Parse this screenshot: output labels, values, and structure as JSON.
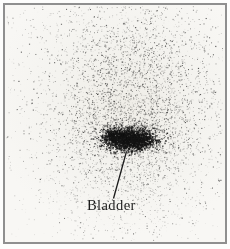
{
  "figure": {
    "label": "Bladder"
  },
  "colors": {
    "page_background": "#fdfdfc",
    "scan_background": "#f4f3ef",
    "scan_background_dark": "#efede7",
    "scan_background_light": "#f8f7f4",
    "frame_border": "#8f8f8f",
    "dot": "#141414",
    "annotation": "#1b1b1b"
  },
  "render": {
    "seed": 1337,
    "clip": {
      "x": 6,
      "y": 6,
      "w": 217,
      "h": 235
    },
    "regions": [
      {
        "name": "background-scatter",
        "type": "uniform",
        "count": 600,
        "x0": 7,
        "y0": 7,
        "x1": 222,
        "y1": 240,
        "rMin": 0.5,
        "rMax": 1.0,
        "aMin": 0.05,
        "aMax": 0.3
      },
      {
        "name": "body-cloud",
        "type": "gaussian",
        "count": 4200,
        "cx": 131,
        "cy": 95,
        "sx": 47,
        "sy": 57,
        "rMin": 0.5,
        "rMax": 1.2,
        "aMin": 0.1,
        "aMax": 0.72
      },
      {
        "name": "lower-fill",
        "type": "gaussian",
        "count": 600,
        "cx": 128,
        "cy": 178,
        "sx": 42,
        "sy": 30,
        "rMin": 0.5,
        "rMax": 1.0,
        "aMin": 0.07,
        "aMax": 0.4
      },
      {
        "name": "bladder-haze",
        "type": "gaussian",
        "count": 700,
        "cx": 127,
        "cy": 138,
        "sx": 24,
        "sy": 14,
        "rMin": 0.5,
        "rMax": 1.2,
        "aMin": 0.15,
        "aMax": 0.65
      },
      {
        "name": "bladder-core",
        "type": "gaussian",
        "count": 1500,
        "cx": 128,
        "cy": 139,
        "sx": 11.5,
        "sy": 5.5,
        "rMin": 0.8,
        "rMax": 1.7,
        "aMin": 0.55,
        "aMax": 0.95
      },
      {
        "name": "bladder-lobe-left",
        "type": "gaussian",
        "count": 350,
        "cx": 113,
        "cy": 136,
        "sx": 6,
        "sy": 4.5,
        "rMin": 0.8,
        "rMax": 1.6,
        "aMin": 0.5,
        "aMax": 0.92
      },
      {
        "name": "bladder-lobe-right",
        "type": "gaussian",
        "count": 350,
        "cx": 143,
        "cy": 140,
        "sx": 7,
        "sy": 4.5,
        "rMin": 0.8,
        "rMax": 1.6,
        "aMin": 0.5,
        "aMax": 0.92
      },
      {
        "name": "bladder-top-fringe",
        "type": "gaussian",
        "count": 250,
        "cx": 127,
        "cy": 130,
        "sx": 16,
        "sy": 4,
        "rMin": 0.6,
        "rMax": 1.2,
        "aMin": 0.3,
        "aMax": 0.7
      }
    ],
    "pointer_line": {
      "x1": 113.5,
      "y1": 198.5,
      "x2": 126.5,
      "y2": 151.5,
      "width": 1.3
    }
  }
}
